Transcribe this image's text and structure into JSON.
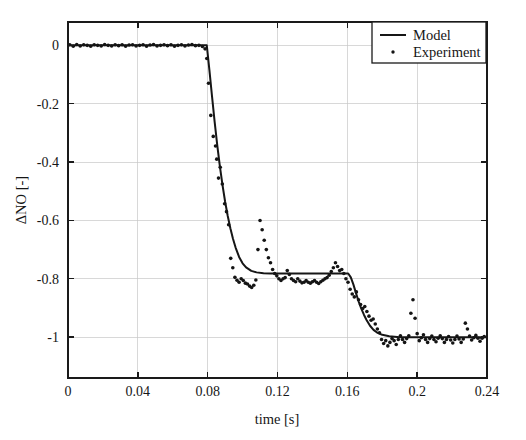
{
  "figure": {
    "background_color": "#ffffff",
    "axes_color": "#1a1a1a",
    "grid_color": "#c8c8c8",
    "series_color": "#161616"
  },
  "axis": {
    "x_title": "time [s]",
    "y_title": "ΔNO [-]",
    "x_ticks": [
      "0",
      "0.04",
      "0.08",
      "0.12",
      "0.16",
      "0.2",
      "0.24"
    ],
    "y_ticks": [
      "0",
      "-0.2",
      "-0.4",
      "-0.6",
      "-0.8",
      "-1"
    ]
  },
  "legend": {
    "entries": [
      {
        "label": "Model",
        "marker": "line"
      },
      {
        "label": "Experiment",
        "marker": "dot"
      }
    ]
  },
  "chart_data": {
    "type": "line",
    "title": "",
    "xlabel": "time [s]",
    "ylabel": "ΔNO [-]",
    "xlim": [
      0,
      0.24
    ],
    "ylim": [
      -1.14,
      0.08
    ],
    "xticks": [
      0,
      0.04,
      0.08,
      0.12,
      0.16,
      0.2,
      0.24
    ],
    "yticks": [
      0,
      -0.2,
      -0.4,
      -0.6,
      -0.8,
      -1
    ],
    "grid": true,
    "legend_position": "upper-right",
    "series": [
      {
        "name": "Model",
        "style": "solid-line",
        "color": "#161616",
        "x": [
          0,
          0.01,
          0.02,
          0.03,
          0.04,
          0.05,
          0.06,
          0.07,
          0.0775,
          0.0795,
          0.081,
          0.0825,
          0.084,
          0.0855,
          0.087,
          0.0885,
          0.09,
          0.0915,
          0.093,
          0.0945,
          0.096,
          0.098,
          0.1,
          0.102,
          0.105,
          0.108,
          0.112,
          0.116,
          0.12,
          0.13,
          0.14,
          0.15,
          0.158,
          0.1605,
          0.162,
          0.1635,
          0.165,
          0.1665,
          0.168,
          0.1695,
          0.171,
          0.173,
          0.175,
          0.177,
          0.18,
          0.184,
          0.19,
          0.2,
          0.21,
          0.22,
          0.23,
          0.24
        ],
        "y": [
          0,
          0,
          0,
          0,
          0,
          0,
          0,
          0,
          0,
          0,
          -0.085,
          -0.175,
          -0.262,
          -0.343,
          -0.415,
          -0.479,
          -0.536,
          -0.585,
          -0.627,
          -0.663,
          -0.693,
          -0.725,
          -0.747,
          -0.761,
          -0.773,
          -0.778,
          -0.781,
          -0.782,
          -0.782,
          -0.782,
          -0.782,
          -0.782,
          -0.782,
          -0.782,
          -0.795,
          -0.82,
          -0.85,
          -0.878,
          -0.902,
          -0.923,
          -0.941,
          -0.961,
          -0.975,
          -0.984,
          -0.992,
          -0.997,
          -1.0,
          -1.0,
          -1.0,
          -1.0,
          -1.0,
          -1.0
        ]
      },
      {
        "name": "Experiment",
        "style": "dots",
        "color": "#141414",
        "x": [
          0.001,
          0.003,
          0.005,
          0.007,
          0.009,
          0.011,
          0.013,
          0.015,
          0.017,
          0.019,
          0.021,
          0.023,
          0.025,
          0.027,
          0.029,
          0.031,
          0.033,
          0.035,
          0.037,
          0.039,
          0.041,
          0.043,
          0.045,
          0.047,
          0.049,
          0.051,
          0.053,
          0.055,
          0.057,
          0.059,
          0.061,
          0.063,
          0.065,
          0.067,
          0.069,
          0.071,
          0.073,
          0.075,
          0.077,
          0.0785,
          0.0795,
          0.0805,
          0.0818,
          0.0832,
          0.0845,
          0.0852,
          0.0862,
          0.0872,
          0.0884,
          0.0897,
          0.0908,
          0.092,
          0.0932,
          0.0944,
          0.0956,
          0.0968,
          0.098,
          0.0992,
          0.1004,
          0.1016,
          0.1028,
          0.104,
          0.1052,
          0.1064,
          0.1076,
          0.1088,
          0.11,
          0.1112,
          0.1124,
          0.1136,
          0.1148,
          0.116,
          0.1172,
          0.1184,
          0.1196,
          0.1208,
          0.122,
          0.1232,
          0.1244,
          0.1256,
          0.1268,
          0.128,
          0.1292,
          0.1304,
          0.1316,
          0.1328,
          0.134,
          0.1352,
          0.1364,
          0.1376,
          0.1388,
          0.14,
          0.1412,
          0.1424,
          0.1436,
          0.1448,
          0.146,
          0.1472,
          0.1484,
          0.1496,
          0.1508,
          0.152,
          0.1532,
          0.1544,
          0.1556,
          0.1568,
          0.158,
          0.1592,
          0.1604,
          0.1616,
          0.1628,
          0.164,
          0.1652,
          0.1664,
          0.1676,
          0.1688,
          0.17,
          0.1712,
          0.1724,
          0.1736,
          0.1748,
          0.176,
          0.1772,
          0.1784,
          0.1796,
          0.1808,
          0.182,
          0.1832,
          0.1844,
          0.1856,
          0.1868,
          0.188,
          0.1892,
          0.1904,
          0.1916,
          0.1928,
          0.194,
          0.1952,
          0.1964,
          0.1976,
          0.1988,
          0.2,
          0.2012,
          0.2024,
          0.2036,
          0.2048,
          0.206,
          0.2072,
          0.2084,
          0.2096,
          0.2108,
          0.212,
          0.2132,
          0.2144,
          0.2156,
          0.2168,
          0.218,
          0.2192,
          0.2204,
          0.2216,
          0.2228,
          0.224,
          0.2252,
          0.2264,
          0.2276,
          0.2288,
          0.23,
          0.2312,
          0.2324,
          0.2336,
          0.2348,
          0.236,
          0.2372,
          0.2384
        ],
        "y": [
          0.002,
          -0.003,
          0.003,
          -0.002,
          0.002,
          0.0,
          -0.003,
          0.002,
          0.0,
          -0.002,
          0.003,
          0.0,
          -0.002,
          0.002,
          -0.001,
          0.002,
          -0.003,
          0.001,
          0.002,
          -0.002,
          0.0,
          0.002,
          -0.003,
          0.001,
          0.003,
          -0.002,
          0.0,
          0.002,
          -0.001,
          0.002,
          -0.003,
          0.0,
          0.002,
          -0.002,
          0.001,
          0.003,
          -0.001,
          0.0,
          -0.004,
          -0.012,
          -0.045,
          -0.13,
          -0.24,
          -0.312,
          -0.345,
          -0.39,
          -0.455,
          -0.418,
          -0.475,
          -0.543,
          -0.57,
          -0.615,
          -0.73,
          -0.762,
          -0.795,
          -0.805,
          -0.812,
          -0.8,
          -0.806,
          -0.815,
          -0.818,
          -0.825,
          -0.83,
          -0.822,
          -0.804,
          -0.7,
          -0.6,
          -0.632,
          -0.668,
          -0.7,
          -0.728,
          -0.745,
          -0.768,
          -0.782,
          -0.79,
          -0.8,
          -0.806,
          -0.8,
          -0.796,
          -0.772,
          -0.785,
          -0.8,
          -0.806,
          -0.81,
          -0.8,
          -0.808,
          -0.814,
          -0.812,
          -0.806,
          -0.812,
          -0.815,
          -0.81,
          -0.806,
          -0.812,
          -0.816,
          -0.81,
          -0.805,
          -0.8,
          -0.796,
          -0.788,
          -0.775,
          -0.762,
          -0.745,
          -0.758,
          -0.772,
          -0.768,
          -0.782,
          -0.8,
          -0.812,
          -0.836,
          -0.852,
          -0.862,
          -0.845,
          -0.872,
          -0.888,
          -0.902,
          -0.895,
          -0.912,
          -0.928,
          -0.942,
          -0.938,
          -0.955,
          -0.972,
          -0.985,
          -1.008,
          -1.022,
          -1.012,
          -1.03,
          -1.018,
          -1.005,
          -1.012,
          -1.025,
          -1.008,
          -0.995,
          -1.008,
          -1.018,
          -1.005,
          -0.995,
          -0.918,
          -0.872,
          -0.935,
          -0.988,
          -1.012,
          -1.002,
          -0.992,
          -1.008,
          -1.018,
          -1.005,
          -0.996,
          -1.008,
          -1.016,
          -1.004,
          -0.995,
          -1.005,
          -1.018,
          -1.008,
          -0.998,
          -1.01,
          -1.02,
          -1.008,
          -0.996,
          -1.006,
          -1.018,
          -1.006,
          -0.952,
          -0.972,
          -0.996,
          -1.01,
          -1.002,
          -0.994,
          -1.004,
          -1.014,
          -1.004,
          -0.998
        ]
      }
    ]
  }
}
